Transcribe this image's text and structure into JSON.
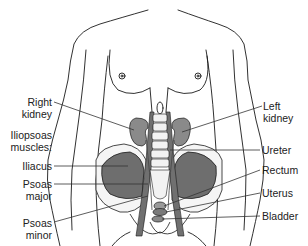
{
  "figure": {
    "colors": {
      "outline": "#1a1a1a",
      "organ_fill": "#8a8a8a",
      "muscle_fill": "#6e6e6e",
      "bone_fill": "#f2f2f2",
      "leader_line": "#333333"
    }
  },
  "labels": {
    "right_kidney": "Right\nkidney",
    "right_kidney_l1": "Right",
    "right_kidney_l2": "kidney",
    "iliopsoas_l1": "Iliopsoas",
    "iliopsoas_l2": "muscles:",
    "iliacus": "Iliacus",
    "psoas_major_l1": "Psoas",
    "psoas_major_l2": "major",
    "psoas_minor_l1": "Psoas",
    "psoas_minor_l2": "minor",
    "left_kidney_l1": "Left",
    "left_kidney_l2": "kidney",
    "ureter": "Ureter",
    "rectum": "Rectum",
    "uterus": "Uterus",
    "bladder": "Bladder"
  }
}
